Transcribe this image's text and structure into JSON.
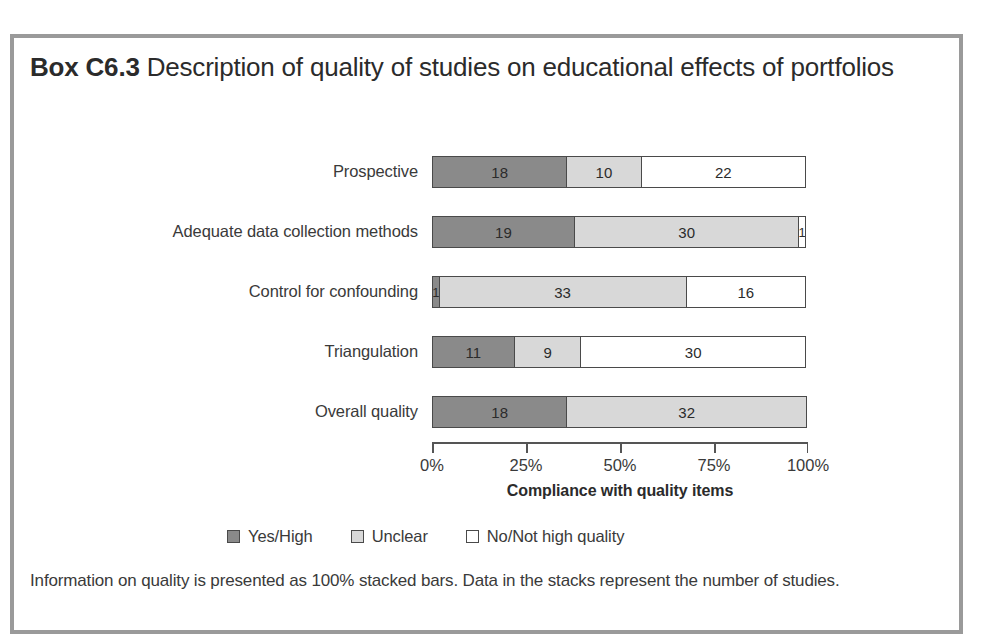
{
  "box": {
    "title_strong": "Box C6.3",
    "title_rest": " Description of quality of studies on educational effects of portfolios",
    "footnote": "Information on quality is presented as 100% stacked bars. Data in the stacks represent the number of studies."
  },
  "legend": {
    "items": [
      {
        "label": "Yes/High",
        "swatch": "yes",
        "color": "#8a8a8a"
      },
      {
        "label": "Unclear",
        "swatch": "unclear",
        "color": "#d8d8d8"
      },
      {
        "label": "No/Not high quality",
        "swatch": "no",
        "color": "#ffffff"
      }
    ]
  },
  "chart_data": {
    "type": "bar",
    "title": "Description of quality of studies on educational effects of portfolios",
    "subtitle": "",
    "stacked": true,
    "normalized_100pct": true,
    "orientation": "horizontal",
    "xlabel": "Compliance with quality items",
    "ylabel": "",
    "xlim": [
      0,
      100
    ],
    "xtick_labels": [
      "0%",
      "25%",
      "50%",
      "75%",
      "100%"
    ],
    "xtick_values": [
      0,
      25,
      50,
      75,
      100
    ],
    "grid": false,
    "legend_position": "bottom",
    "categories": [
      "Prospective",
      "Adequate data collection methods",
      "Control for confounding",
      "Triangulation",
      "Overall quality"
    ],
    "series": [
      {
        "name": "Yes/High",
        "color": "#8a8a8a",
        "values": [
          18,
          19,
          1,
          11,
          18
        ]
      },
      {
        "name": "Unclear",
        "color": "#d8d8d8",
        "values": [
          10,
          30,
          33,
          9,
          32
        ]
      },
      {
        "name": "No/Not high quality",
        "color": "#ffffff",
        "values": [
          22,
          1,
          16,
          30,
          0
        ]
      }
    ],
    "row_totals": [
      50,
      50,
      50,
      50,
      50
    ],
    "units": "number of studies",
    "rows": [
      {
        "label": "Prospective",
        "segments": [
          {
            "series": "Yes/High",
            "value": 18,
            "pct": 36
          },
          {
            "series": "Unclear",
            "value": 10,
            "pct": 20
          },
          {
            "series": "No/Not high quality",
            "value": 22,
            "pct": 44
          }
        ]
      },
      {
        "label": "Adequate data collection methods",
        "segments": [
          {
            "series": "Yes/High",
            "value": 19,
            "pct": 38
          },
          {
            "series": "Unclear",
            "value": 30,
            "pct": 60
          },
          {
            "series": "No/Not high quality",
            "value": 1,
            "pct": 2
          }
        ]
      },
      {
        "label": "Control for confounding",
        "segments": [
          {
            "series": "Yes/High",
            "value": 1,
            "pct": 2
          },
          {
            "series": "Unclear",
            "value": 33,
            "pct": 66
          },
          {
            "series": "No/Not high quality",
            "value": 16,
            "pct": 32
          }
        ]
      },
      {
        "label": "Triangulation",
        "segments": [
          {
            "series": "Yes/High",
            "value": 11,
            "pct": 22
          },
          {
            "series": "Unclear",
            "value": 9,
            "pct": 18
          },
          {
            "series": "No/Not high quality",
            "value": 30,
            "pct": 60
          }
        ]
      },
      {
        "label": "Overall quality",
        "segments": [
          {
            "series": "Yes/High",
            "value": 18,
            "pct": 36
          },
          {
            "series": "Unclear",
            "value": 32,
            "pct": 64
          }
        ]
      }
    ]
  }
}
